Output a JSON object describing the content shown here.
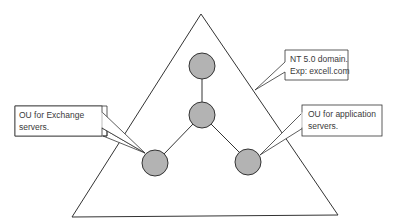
{
  "diagram": {
    "domain_shape": "triangle",
    "colors": {
      "stroke": "#333333",
      "node_fill": "#b3b3b3",
      "background": "#ffffff"
    },
    "nodes": [
      {
        "id": "top"
      },
      {
        "id": "middle"
      },
      {
        "id": "left"
      },
      {
        "id": "right"
      }
    ],
    "callouts": {
      "domain": {
        "line1": "NT 5.0 domain.",
        "line2": "Exp: excell.com"
      },
      "exchange": {
        "line1": "OU for Exchange",
        "line2": "servers."
      },
      "application": {
        "line1": "OU for application",
        "line2": "servers."
      }
    }
  }
}
